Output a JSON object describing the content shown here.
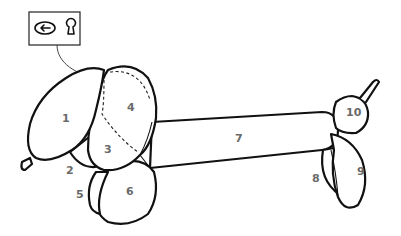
{
  "diagram": {
    "legend_icons": [
      "twist-rotate-icon",
      "lock-twist-icon"
    ],
    "parts": [
      {
        "id": "1",
        "label": "1",
        "x": 66,
        "y": 118
      },
      {
        "id": "2",
        "label": "2",
        "x": 70,
        "y": 170
      },
      {
        "id": "3",
        "label": "3",
        "x": 108,
        "y": 152
      },
      {
        "id": "4",
        "label": "4",
        "x": 130,
        "y": 110
      },
      {
        "id": "5",
        "label": "5",
        "x": 80,
        "y": 196
      },
      {
        "id": "6",
        "label": "6",
        "x": 130,
        "y": 194
      },
      {
        "id": "7",
        "label": "7",
        "x": 239,
        "y": 141
      },
      {
        "id": "8",
        "label": "8",
        "x": 316,
        "y": 181
      },
      {
        "id": "9",
        "label": "9",
        "x": 361,
        "y": 174
      },
      {
        "id": "10",
        "label": "10",
        "x": 353,
        "y": 116
      }
    ],
    "colors": {
      "outline": "#111111",
      "label": "#6a6a6a",
      "background": "#ffffff"
    }
  }
}
